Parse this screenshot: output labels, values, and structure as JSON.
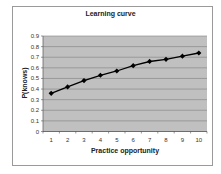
{
  "chart_data": {
    "type": "line",
    "title": "Learning curve",
    "xlabel": "Practice opportunity",
    "ylabel": "P(knows)",
    "x": [
      1,
      2,
      3,
      4,
      5,
      6,
      7,
      8,
      9,
      10
    ],
    "series": [
      {
        "name": "P(knows)",
        "values": [
          0.36,
          0.42,
          0.48,
          0.53,
          0.57,
          0.62,
          0.66,
          0.68,
          0.71,
          0.74
        ]
      }
    ],
    "yticks": [
      "0",
      "0.1",
      "0.2",
      "0.3",
      "0.4",
      "0.5",
      "0.6",
      "0.7",
      "0.8",
      "0.9"
    ],
    "xticks": [
      "1",
      "2",
      "3",
      "4",
      "5",
      "6",
      "7",
      "8",
      "9",
      "10"
    ],
    "ylim": [
      0,
      0.9
    ],
    "grid": true,
    "legend": "none",
    "marker": "diamond"
  },
  "colors": {
    "plot_background": "#c0c0c0",
    "gridline": "#808080",
    "line": "#000000",
    "frame": "#9a9a9a"
  }
}
